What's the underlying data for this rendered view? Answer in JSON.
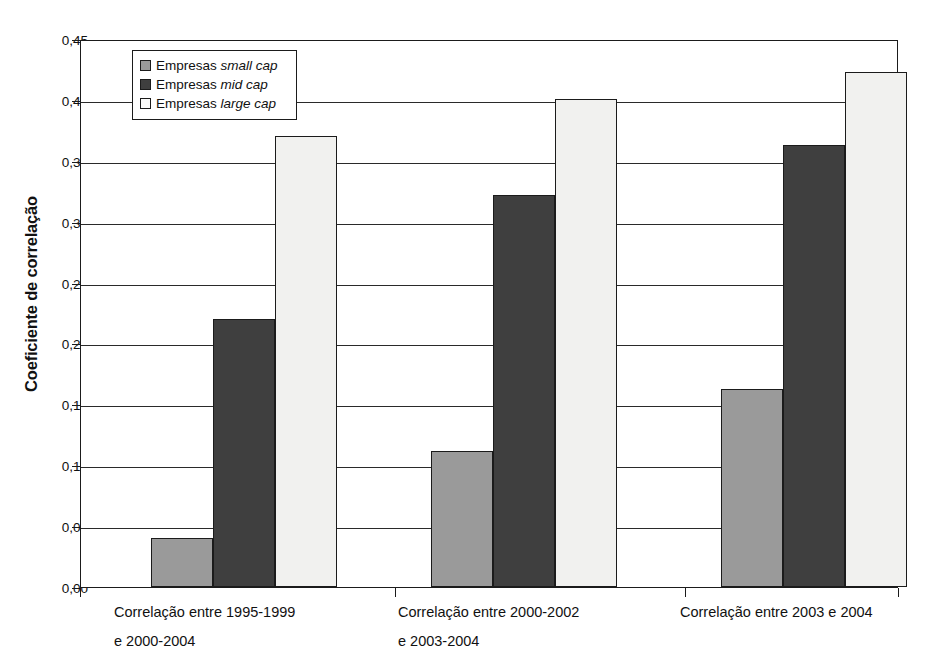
{
  "chart_data": {
    "type": "bar",
    "title": "",
    "xlabel": "",
    "ylabel": "Coeficiente de correlação",
    "ylim": [
      0.0,
      0.45
    ],
    "ytick_step": 0.05,
    "grid": true,
    "legend_position": "top-left-inside",
    "categories": [
      "Correlação entre 1995-1999 e 2000-2004",
      "Correlação entre 2000-2002 e 2003-2004",
      "Correlação entre 2003 e 2004"
    ],
    "category_lines": [
      [
        "Correlação entre 1995-1999",
        "e 2000-2004"
      ],
      [
        "Correlação entre 2000-2002",
        "e 2003-2004"
      ],
      [
        "Correlação entre 2003 e 2004",
        ""
      ]
    ],
    "ytick_labels": [
      "0,00",
      "0,05",
      "0,10",
      "0,15",
      "0,20",
      "0,25",
      "0,30",
      "0,35",
      "0,40",
      "0,45"
    ],
    "ytick_values": [
      0.0,
      0.05,
      0.1,
      0.15,
      0.2,
      0.25,
      0.3,
      0.35,
      0.4,
      0.45
    ],
    "series": [
      {
        "name": "Empresas small cap",
        "name_plain": "Empresas ",
        "name_italic": "small cap",
        "color": "#9a9a9a",
        "values": [
          0.04,
          0.112,
          0.163
        ]
      },
      {
        "name": "Empresas mid cap",
        "name_plain": "Empresas ",
        "name_italic": "mid cap",
        "color": "#3f3f3f",
        "values": [
          0.22,
          0.322,
          0.363
        ]
      },
      {
        "name": "Empresas large cap",
        "name_plain": "Empresas ",
        "name_italic": "large cap",
        "color": "#f1f1ef",
        "values": [
          0.37,
          0.401,
          0.423
        ]
      }
    ]
  },
  "colors": {
    "axis": "#1b1b1b",
    "grid": "#2a2a2a",
    "background": "#ffffff",
    "small_cap": "#9a9a9a",
    "mid_cap": "#3f3f3f",
    "large_cap": "#f1f1ef"
  }
}
